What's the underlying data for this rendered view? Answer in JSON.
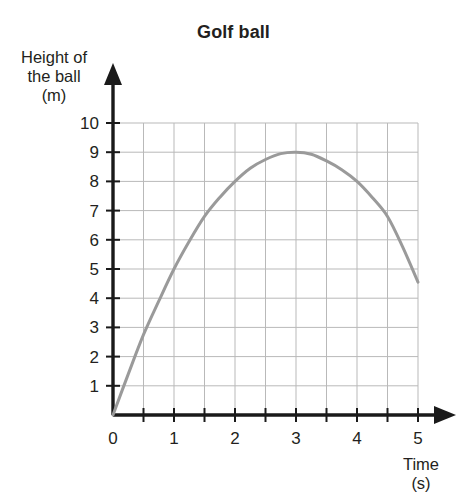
{
  "chart_data": {
    "type": "line",
    "title": "Golf ball",
    "xlabel": "Time\n(s)",
    "ylabel": "Height of the ball\n(m)",
    "xlabel_lines": [
      "Time",
      "(s)"
    ],
    "ylabel_lines": [
      "Height of",
      "the ball",
      "(m)"
    ],
    "xlim": [
      0,
      5
    ],
    "ylim": [
      0,
      10
    ],
    "grid": true,
    "legend": "none",
    "x_major_ticks": [
      0,
      1,
      2,
      3,
      4,
      5
    ],
    "x_tick_labels": [
      "0",
      "1",
      "2",
      "3",
      "4",
      "5"
    ],
    "x_minor_step": 0.5,
    "y_major_ticks": [
      1,
      2,
      3,
      4,
      5,
      6,
      7,
      8,
      9,
      10
    ],
    "y_tick_labels": [
      "1",
      "2",
      "3",
      "4",
      "5",
      "6",
      "7",
      "8",
      "9",
      "10"
    ],
    "series": [
      {
        "name": "Golf ball height",
        "color": "#9a9a9a",
        "x": [
          0,
          0.25,
          0.5,
          0.75,
          1,
          1.25,
          1.5,
          1.75,
          2,
          2.25,
          2.5,
          2.75,
          3,
          3.25,
          3.5,
          3.75,
          4,
          4.25,
          4.5,
          4.75,
          5
        ],
        "y": [
          0,
          1.4,
          2.75,
          3.9,
          5.0,
          5.95,
          6.8,
          7.45,
          8.0,
          8.45,
          8.75,
          8.95,
          9.0,
          8.93,
          8.7,
          8.4,
          8.0,
          7.45,
          6.8,
          5.75,
          4.55
        ]
      }
    ],
    "annotations": []
  },
  "axes": {
    "x_arrow": true,
    "y_arrow": true,
    "axis_color": "#1a1a1a",
    "grid_color": "#b9b9b9"
  }
}
